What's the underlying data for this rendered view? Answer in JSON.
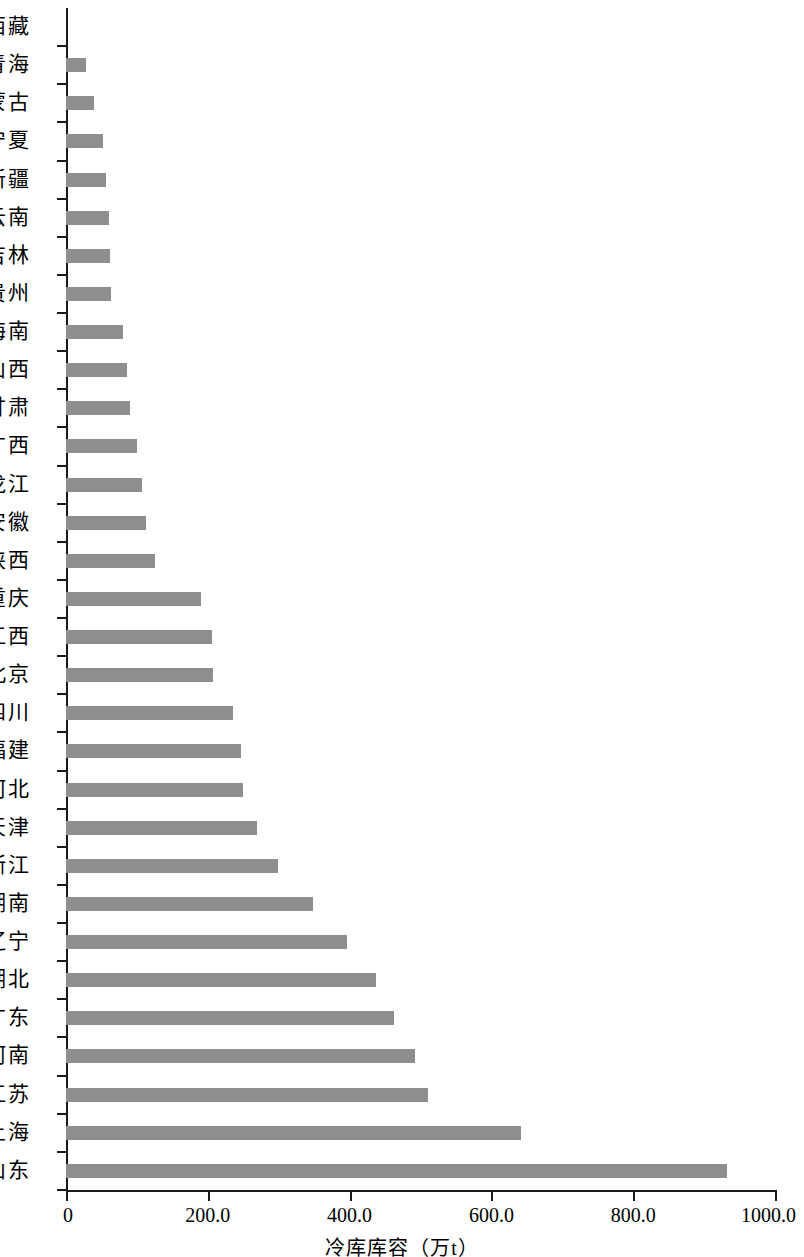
{
  "chart_data": {
    "type": "bar",
    "orientation": "horizontal",
    "title": "",
    "xlabel": "冷库库容（万t）",
    "ylabel": "",
    "xlim": [
      0,
      1000
    ],
    "grid": false,
    "legend": null,
    "bar_color": "#8e8e8e",
    "axis_color": "#1a1a1a",
    "xticks": [
      0,
      200,
      400,
      600,
      800,
      1000
    ],
    "xtick_labels": [
      "0",
      "200.0",
      "400.0",
      "600.0",
      "800.0",
      "1000.0"
    ],
    "categories": [
      "西藏",
      "青海",
      "内蒙古",
      "宁夏",
      "新疆",
      "云南",
      "吉林",
      "贵州",
      "海南",
      "山西",
      "甘肃",
      "广西",
      "黑龙江",
      "安徽",
      "陕西",
      "重庆",
      "江西",
      "北京",
      "四川",
      "福建",
      "河北",
      "天津",
      "浙江",
      "湖南",
      "辽宁",
      "湖北",
      "广东",
      "河南",
      "江苏",
      "上海",
      "山东"
    ],
    "values": [
      0,
      28,
      40,
      52,
      56,
      60,
      62,
      63,
      81,
      86,
      90,
      100,
      107,
      113,
      126,
      190,
      206,
      208,
      236,
      247,
      250,
      270,
      299,
      349,
      397,
      437,
      462,
      492,
      510,
      642,
      932
    ]
  }
}
